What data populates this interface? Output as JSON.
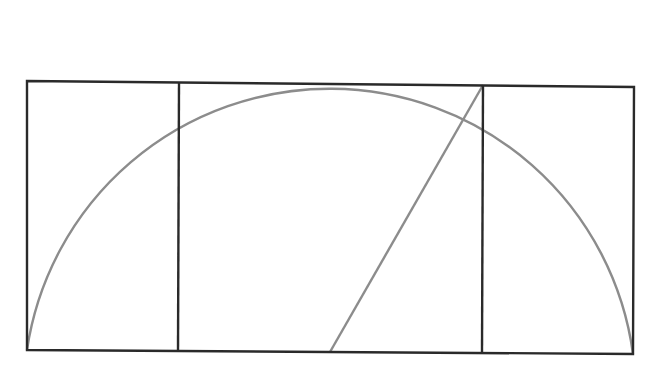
{
  "diagram": {
    "colors": {
      "background": "#ffffff",
      "rect_stroke": "#2a2a2a",
      "construction_stroke": "#8c8c8c"
    },
    "outer_rectangle": {
      "top_left": [
        27,
        81
      ],
      "top_right": [
        634,
        87
      ],
      "bottom_right": [
        633,
        354
      ],
      "bottom_left": [
        27,
        350
      ]
    },
    "inner_square": {
      "top_left": [
        179,
        83
      ],
      "top_right": [
        483,
        85
      ],
      "bottom_right": [
        482,
        353
      ],
      "bottom_left": [
        178,
        351
      ]
    },
    "diagonal": {
      "from": [
        330,
        352
      ],
      "to": [
        483,
        85
      ]
    },
    "semicircle": {
      "center": [
        330,
        352
      ],
      "radius": 306,
      "start": [
        27,
        350
      ],
      "end": [
        633,
        354
      ]
    }
  }
}
